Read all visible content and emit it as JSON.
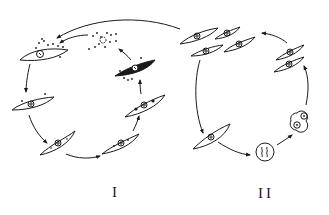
{
  "diagram": {
    "type": "biological cycle diagram",
    "colors": {
      "stroke": "#1a1a1a",
      "background": "#ffffff"
    },
    "cycles": [
      {
        "id": "cycle-1",
        "label": "I",
        "stages": [
          {
            "id": "s1",
            "description": "spindle cell with nucleus, surrounded by granules"
          },
          {
            "id": "s2",
            "description": "spindle cell with nucleus and few granules"
          },
          {
            "id": "s3",
            "description": "spindle cell with nucleus and internal dots"
          },
          {
            "id": "s4",
            "description": "spindle cell with nucleus and granules"
          },
          {
            "id": "s5",
            "description": "spindle cell with nucleus and dark inclusions"
          },
          {
            "id": "s6",
            "description": "dark spindle cell with granules around"
          },
          {
            "id": "s7",
            "description": "disintegrating cell releasing granules"
          }
        ]
      },
      {
        "id": "cycle-2",
        "label": "II",
        "stages": [
          {
            "id": "t1",
            "description": "cluster of four spindle cells"
          },
          {
            "id": "t2",
            "description": "single spindle cell"
          },
          {
            "id": "t3",
            "description": "round cell with chromatin"
          },
          {
            "id": "t4",
            "description": "double round cell (division)"
          },
          {
            "id": "t5",
            "description": "pair of spindle cells"
          }
        ]
      }
    ]
  }
}
